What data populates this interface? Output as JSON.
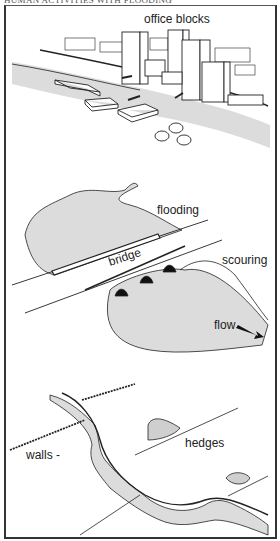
{
  "caption": "HUMAN ACTIVITIES WITH FLOODING",
  "panels": [
    {
      "id": "urban",
      "labels": {
        "office_blocks": "office blocks"
      }
    },
    {
      "id": "bridge",
      "labels": {
        "flooding": "flooding",
        "bridge": "bridge",
        "scouring": "scouring",
        "flow": "flow"
      }
    },
    {
      "id": "rural",
      "labels": {
        "walls": "walls -",
        "hedges": "hedges"
      }
    }
  ],
  "colors": {
    "water": "#dcdcdc",
    "ink": "#222222",
    "border": "#333333"
  }
}
